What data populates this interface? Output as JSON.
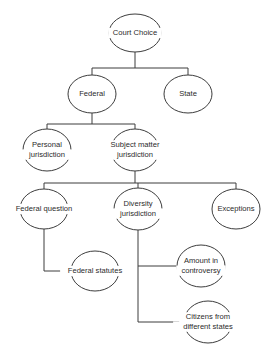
{
  "diagram": {
    "title": "Court Choice",
    "type": "hierarchical-tree",
    "colors": {
      "stroke": "#3c3c3c",
      "text": "#2b2b2b",
      "background": "#ffffff"
    },
    "nodes": [
      {
        "id": "court-choice",
        "label": "Court Choice",
        "lines": [
          "Court Choice"
        ],
        "cx": 135,
        "cy": 33,
        "rx": 26,
        "ry": 19,
        "level": 0
      },
      {
        "id": "federal",
        "label": "Federal",
        "lines": [
          "Federal"
        ],
        "cx": 92,
        "cy": 94,
        "rx": 24,
        "ry": 19,
        "level": 1
      },
      {
        "id": "state",
        "label": "State",
        "lines": [
          "State"
        ],
        "cx": 188,
        "cy": 94,
        "rx": 24,
        "ry": 19,
        "level": 1
      },
      {
        "id": "personal-jurisdiction",
        "label": "Personal jurisdiction",
        "lines": [
          "Personal",
          "jurisdiction"
        ],
        "cx": 47,
        "cy": 150,
        "rx": 24,
        "ry": 21,
        "level": 2
      },
      {
        "id": "subject-matter-jurisdiction",
        "label": "Subject matter jurisdiction",
        "lines": [
          "Subject matter",
          "jurisdiction"
        ],
        "cx": 135,
        "cy": 150,
        "rx": 24,
        "ry": 21,
        "level": 2
      },
      {
        "id": "federal-question",
        "label": "Federal question",
        "lines": [
          "Federal question"
        ],
        "cx": 44,
        "cy": 209,
        "rx": 24,
        "ry": 20,
        "level": 3
      },
      {
        "id": "diversity-jurisdiction",
        "label": "Diversity jurisdiction",
        "lines": [
          "Diversity",
          "jurisdiction"
        ],
        "cx": 138,
        "cy": 209,
        "rx": 24,
        "ry": 21,
        "level": 3
      },
      {
        "id": "exceptions",
        "label": "Exceptions",
        "lines": [
          "Exceptions"
        ],
        "cx": 236,
        "cy": 209,
        "rx": 24,
        "ry": 20,
        "level": 3
      },
      {
        "id": "federal-statutes",
        "label": "Federal statutes",
        "lines": [
          "Federal statutes"
        ],
        "cx": 95,
        "cy": 271,
        "rx": 24,
        "ry": 20,
        "level": 4
      },
      {
        "id": "amount-in-controversy",
        "label": "Amount in controversy",
        "lines": [
          "Amount in",
          "controversy"
        ],
        "cx": 201,
        "cy": 266,
        "rx": 24,
        "ry": 21,
        "level": 4
      },
      {
        "id": "citizens-different-states",
        "label": "Citizens from different states",
        "lines": [
          "Citizens from",
          "different states"
        ],
        "cx": 208,
        "cy": 322,
        "rx": 24,
        "ry": 21,
        "level": 4
      }
    ],
    "edges": [
      {
        "id": "edge-court-choice-federal",
        "from": "court-choice",
        "to": "federal",
        "path": "M 135 52 L 135 68 M 92 68 L 188 68 M 92 68 L 92 75"
      },
      {
        "id": "edge-court-choice-state",
        "from": "court-choice",
        "to": "state",
        "path": "M 188 68 L 188 75"
      },
      {
        "id": "edge-federal-personal",
        "from": "federal",
        "to": "personal-jurisdiction",
        "path": "M 92 113 L 92 124 M 47 124 L 135 124 M 47 124 L 47 129"
      },
      {
        "id": "edge-federal-subject-matter",
        "from": "federal",
        "to": "subject-matter-jurisdiction",
        "path": "M 135 124 L 135 129"
      },
      {
        "id": "edge-subject-matter-federal-question",
        "from": "subject-matter-jurisdiction",
        "to": "federal-question",
        "path": "M 135 171 L 135 183 M 44 183 L 236 183 M 44 183 L 44 189"
      },
      {
        "id": "edge-subject-matter-diversity",
        "from": "subject-matter-jurisdiction",
        "to": "diversity-jurisdiction",
        "path": "M 138 183 L 138 188"
      },
      {
        "id": "edge-subject-matter-exceptions",
        "from": "subject-matter-jurisdiction",
        "to": "exceptions",
        "path": "M 236 183 L 236 189"
      },
      {
        "id": "edge-federal-question-federal-statutes",
        "from": "federal-question",
        "to": "federal-statutes",
        "path": "M 44 229 L 44 271 L 72 271"
      },
      {
        "id": "edge-diversity-amount",
        "from": "diversity-jurisdiction",
        "to": "amount-in-controversy",
        "path": "M 138 230 L 138 266 L 178 266"
      },
      {
        "id": "edge-diversity-citizens",
        "from": "diversity-jurisdiction",
        "to": "citizens-different-states",
        "path": "M 138 266 L 138 322 L 185 322"
      }
    ]
  }
}
